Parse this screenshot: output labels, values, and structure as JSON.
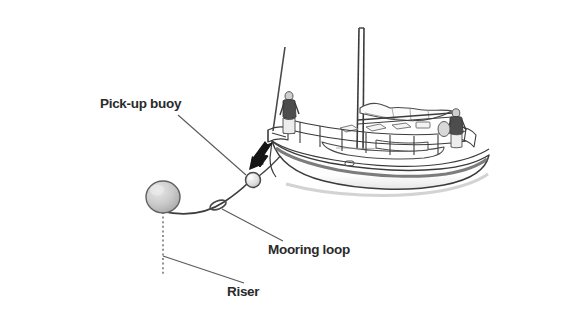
{
  "figure": {
    "width": 582,
    "height": 326,
    "background_color": "#ffffff"
  },
  "labels": {
    "pickup_buoy": "Pick-up buoy",
    "mooring_loop": "Mooring loop",
    "riser": "Riser"
  },
  "scene": {
    "water": {
      "name": "sea-surface",
      "style": "horizontal gray wave streaks",
      "color_light": "#f2f2f2",
      "color_mid": "#d8d8d8",
      "color_dark": "#b4b4b4"
    },
    "vessel": {
      "name": "sailboat",
      "type": "sloop",
      "hull_color": "#ffffff",
      "outline_color": "#3a3a3a",
      "sheer_stripe_color": "#6e6e6e",
      "crew_count": 2,
      "crew": [
        {
          "position": "bow",
          "shirt_color": "#4a4a4a",
          "trouser_color": "#e8e8e8"
        },
        {
          "position": "stern",
          "shirt_color": "#4a4a4a",
          "trouser_color": "#e8e8e8"
        }
      ],
      "parts": [
        "mast",
        "boom",
        "furled-mainsail",
        "forestay",
        "lifelines",
        "stanchions",
        "pulpit",
        "pushpit",
        "coachroof",
        "porthole"
      ]
    },
    "mooring": {
      "buoy_color": "#c4c4c4",
      "buoy_outline": "#5a5a5a",
      "pickup_buoy_color": "#e4e4e4",
      "riser_line_style": "dotted",
      "line_color": "#3a3a3a"
    },
    "arrow": {
      "name": "approach-arrow",
      "color": "#1a1a1a",
      "direction": "down-left",
      "meaning": "boat approaches pick-up buoy"
    }
  }
}
